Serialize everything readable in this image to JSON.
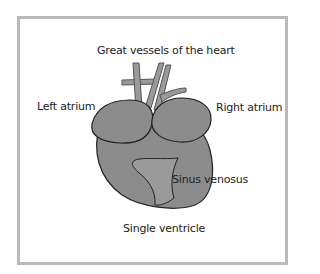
{
  "diagram": {
    "title": "Great vessels of the heart",
    "labels": {
      "left_atrium": "Left atrium",
      "right_atrium": "Right atrium",
      "sinus_venosus": "Sinus venosus",
      "single_ventricle": "Single ventricle",
      "great_vessels": "Great vessels of the heart"
    },
    "colors": {
      "organ_fill": "#8c8c8c",
      "sinus_fill": "#9a9a9a",
      "outline": "#222222",
      "frame": "#b9b9b9"
    }
  }
}
